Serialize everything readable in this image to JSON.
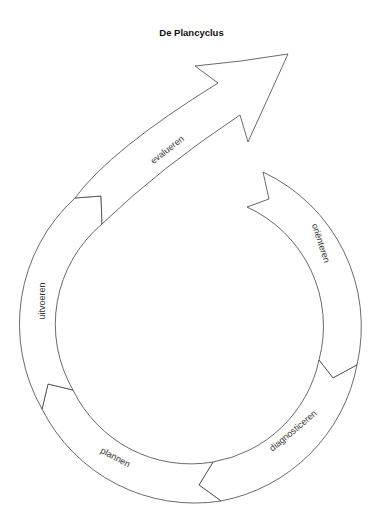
{
  "title": "De Plancyclus",
  "cycle": {
    "phases": [
      {
        "label": "oriënteren"
      },
      {
        "label": "diagnosticeren"
      },
      {
        "label": "plannen"
      },
      {
        "label": "uitvoeren"
      },
      {
        "label": "evalueren"
      }
    ]
  },
  "colors": {
    "stroke": "#444444",
    "fill": "#ffffff",
    "text": "#333333"
  }
}
